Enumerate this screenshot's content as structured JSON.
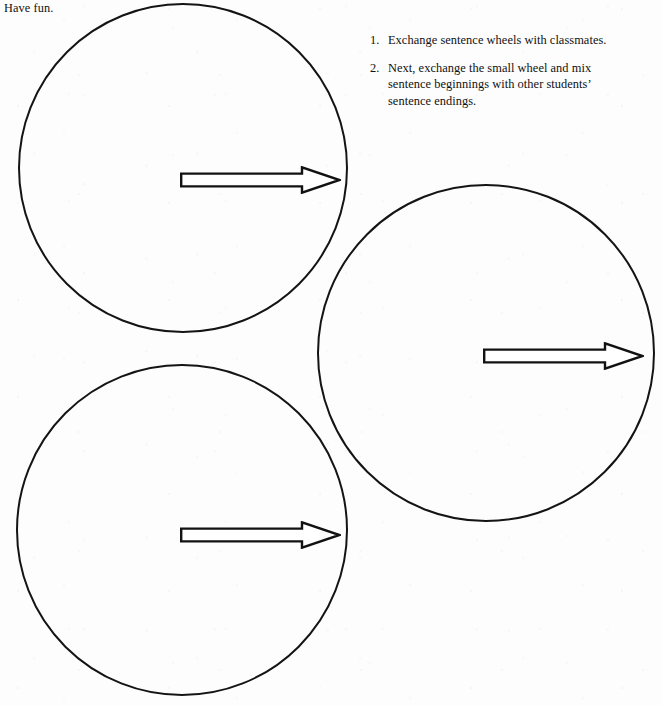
{
  "page": {
    "background_color": "#fdfdfd",
    "ink_color": "#141414",
    "width": 662,
    "height": 705,
    "heading": "Have fun."
  },
  "instructions": {
    "items": [
      {
        "marker": "1.",
        "text": "Exchange sentence wheels with classmates."
      },
      {
        "marker": "2.",
        "text": "Next, exchange the small wheel and mix sentence beginnings with other students’ sentence endings."
      }
    ]
  },
  "wheels": [
    {
      "name": "sentence-wheel-top-left",
      "left": 18,
      "top": 3,
      "diameter": 330
    },
    {
      "name": "sentence-wheel-right",
      "left": 317,
      "top": 184,
      "diameter": 338
    },
    {
      "name": "sentence-wheel-bottom-left",
      "left": 16,
      "top": 364,
      "diameter": 332
    }
  ],
  "arrows": [
    {
      "name": "direction-arrow-top-left",
      "left": 180,
      "top": 166,
      "width": 161,
      "height": 28,
      "direction": "right"
    },
    {
      "name": "direction-arrow-right",
      "left": 483,
      "top": 342,
      "width": 161,
      "height": 28,
      "direction": "right"
    },
    {
      "name": "direction-arrow-bottom-left",
      "left": 180,
      "top": 521,
      "width": 161,
      "height": 28,
      "direction": "right"
    }
  ]
}
